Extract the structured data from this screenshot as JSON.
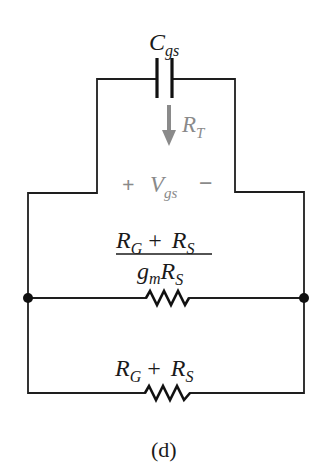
{
  "figure": {
    "caption": "(d)",
    "colors": {
      "wire": "#1e1e1e",
      "annotation": "#8a8a8a"
    }
  },
  "components": {
    "capacitor": {
      "symbol": "C",
      "subscript": "gs"
    },
    "test_arrow": {
      "symbol": "R",
      "subscript": "T",
      "direction": "down"
    },
    "control_voltage": {
      "plus": "+",
      "symbol": "V",
      "subscript": "gs",
      "minus": "−"
    },
    "resistor_top": {
      "num_a": "R",
      "num_a_sub": "G",
      "num_op": "+",
      "num_b": "R",
      "num_b_sub": "S",
      "den_a": "g",
      "den_a_sub": "m",
      "den_b": "R",
      "den_b_sub": "S"
    },
    "resistor_bottom": {
      "a": "R",
      "a_sub": "G",
      "op": "+",
      "b": "R",
      "b_sub": "S"
    }
  }
}
